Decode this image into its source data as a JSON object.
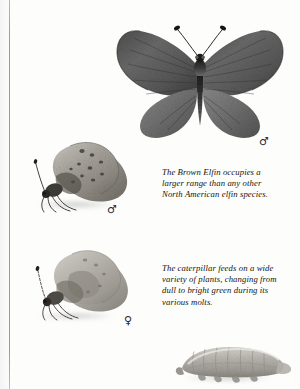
{
  "page": {
    "background_color": "#fdfdfc",
    "gutter_rule_color": "#9a9a9a",
    "text_color": "#15140f"
  },
  "captions": [
    {
      "id": "brown-elfin-range",
      "lines": [
        "The Brown Elfin occupies a",
        "larger range than any other",
        "North American elfin species."
      ]
    },
    {
      "id": "caterpillar-diet",
      "lines": [
        "The caterpillar feeds on a wide",
        "variety of plants, changing from",
        "dull to bright green during its",
        "various molts."
      ]
    }
  ],
  "sex_symbols": [
    {
      "id": "dorsal-male",
      "glyph": "♂",
      "label": "male"
    },
    {
      "id": "lateral-upper-male",
      "glyph": "♂",
      "label": "male"
    },
    {
      "id": "lateral-lower-female",
      "glyph": "♀",
      "label": "female"
    }
  ],
  "specimens": [
    {
      "id": "butterfly-dorsal",
      "label": "butterfly-dorsal-spread-specimen"
    },
    {
      "id": "butterfly-lateral-upper",
      "label": "butterfly-lateral-male-specimen"
    },
    {
      "id": "butterfly-lateral-lower",
      "label": "butterfly-lateral-female-specimen"
    },
    {
      "id": "caterpillar",
      "label": "caterpillar-larva-specimen"
    }
  ]
}
